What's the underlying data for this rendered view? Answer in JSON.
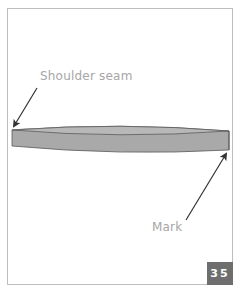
{
  "diagram": {
    "labels": {
      "shoulder_seam": "Shoulder seam",
      "mark": "Mark"
    },
    "page_badge": "35",
    "colors": {
      "band_fill": "#a9a9a9",
      "band_top": "#b8b8b8",
      "band_outline": "#5a5a5a",
      "arrow": "#333333",
      "label_text": "#a6a6a6",
      "badge_bg": "#6e6e6e",
      "badge_text": "#ffffff",
      "frame": "#bdbdbd"
    }
  }
}
